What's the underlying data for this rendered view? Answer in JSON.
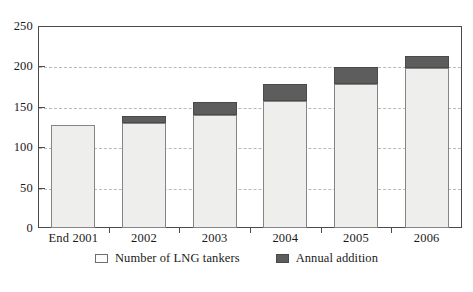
{
  "chart_data": {
    "type": "bar",
    "stacked": true,
    "title": "",
    "subtitle": "",
    "xlabel": "",
    "ylabel": "",
    "categories": [
      "End 2001",
      "2002",
      "2003",
      "2004",
      "2005",
      "2006"
    ],
    "series": [
      {
        "name": "Number of LNG tankers",
        "color": "#eeeeec",
        "values": [
          128,
          130,
          140,
          157,
          178,
          198
        ]
      },
      {
        "name": "Annual addition",
        "color": "#5d5d5d",
        "values": [
          0,
          9,
          16,
          21,
          21,
          15
        ]
      }
    ],
    "totals": [
      128,
      139,
      156,
      178,
      199,
      213
    ],
    "ylim": [
      0,
      250
    ],
    "ytick_labels": [
      "0",
      "50",
      "100",
      "150",
      "200",
      "250"
    ],
    "ytick_values": [
      0,
      50,
      100,
      150,
      200,
      250
    ],
    "grid": "horizontal-dashed",
    "legend_position": "bottom-center"
  },
  "legend": {
    "items": [
      {
        "label": "Number of LNG tankers",
        "swatch": "light-outlined-square"
      },
      {
        "label": "Annual addition",
        "swatch": "dark-filled-square"
      }
    ]
  },
  "colors": {
    "bar_base_fill": "#eeeeec",
    "bar_base_stroke": "#858585",
    "bar_addition_fill": "#5d5d5d",
    "bar_addition_stroke": "#4a4a4a",
    "gridline": "#b9b9b9",
    "frame": "#4a4a4a",
    "text": "#1a1a1a",
    "background": "#ffffff"
  }
}
